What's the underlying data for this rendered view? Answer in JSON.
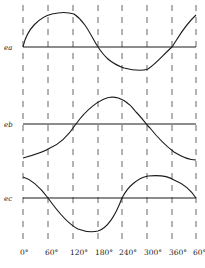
{
  "diagram": {
    "title": "",
    "colors": {
      "line": "#1a1a1a",
      "dash": "#555555",
      "background": "#ffffff"
    },
    "x_positions": [
      23,
      48,
      73,
      98,
      122,
      147,
      172,
      196
    ],
    "x_tick_labels": [
      "0°",
      "60°",
      "120°",
      "180°",
      "240°",
      "300°",
      "360°",
      "60°"
    ],
    "vertical_line_top": 5,
    "vertical_line_bottom": 243,
    "tick_label_y": 255,
    "waveforms": [
      {
        "label": "ea",
        "axis_y": 47,
        "label_x": 4,
        "path": "M23,47 C27,28 40,17 52,14 C60,12 68,12 74,14 C86,22 92,38 98,47 C104,56 110,63 124,68 C132,70 142,71 148,69 C156,64 164,54 172,47 C178,38 184,26 196,15"
      },
      {
        "label": "eb",
        "axis_y": 124,
        "label_x": 4,
        "path": "M23,158 C34,155 44,152 50,148 C60,144 68,136 76,124 C86,110 100,98 112,97 C122,97 130,104 136,112 C142,118 146,124 150,128 C158,138 166,146 174,152 C182,157 190,160 196,160"
      },
      {
        "label": "ec",
        "axis_y": 198,
        "label_x": 4,
        "path": "M23,177 C34,180 42,190 48,198 C58,212 68,224 78,229 C86,232 94,232 98,231 C108,228 116,214 122,198 C128,186 138,178 148,176 C158,175 168,176 174,180 C184,184 192,192 196,198"
      }
    ]
  }
}
